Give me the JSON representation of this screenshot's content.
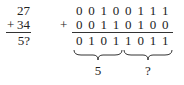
{
  "decimal": {
    "addend1": "27",
    "addend2": "34",
    "operator": "+",
    "result": "5?"
  },
  "binary": {
    "operator": "+",
    "addend1": [
      "0",
      "0",
      "1",
      "0",
      "0",
      "1",
      "1",
      "1"
    ],
    "addend2": [
      "0",
      "0",
      "1",
      "1",
      "0",
      "1",
      "0",
      "0"
    ],
    "result": [
      "0",
      "1",
      "0",
      "1",
      "1",
      "0",
      "1",
      "1"
    ]
  },
  "braces": {
    "high_nibble_label": "5",
    "low_nibble_label": "?"
  }
}
